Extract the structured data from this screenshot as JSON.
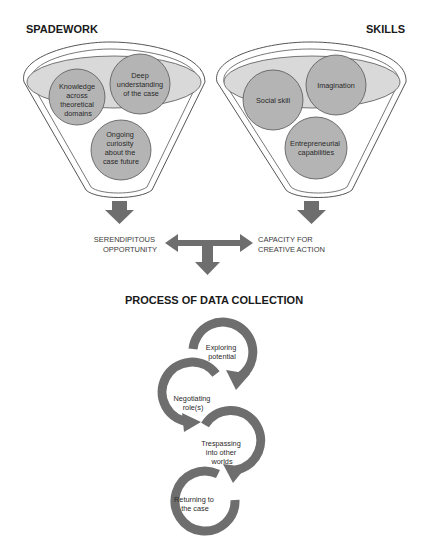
{
  "colors": {
    "background": "#ffffff",
    "funnel_outline": "#555555",
    "ellipse_fill": "#d9d9d9",
    "circle_fill": "#b4b4b4",
    "arrow_fill": "#6e6e6e",
    "text": "#222222"
  },
  "spadework": {
    "title": "SPADEWORK",
    "items": [
      {
        "lines": [
          "Knowledge",
          "across",
          "theoretical",
          "domains"
        ]
      },
      {
        "lines": [
          "Deep",
          "understanding",
          "of the case"
        ]
      },
      {
        "lines": [
          "Ongoing",
          "curiosity",
          "about the",
          "case future"
        ]
      }
    ]
  },
  "skills": {
    "title": "SKILLS",
    "items": [
      {
        "lines": [
          "Social skill"
        ]
      },
      {
        "lines": [
          "Imagination"
        ]
      },
      {
        "lines": [
          "Entrepreneurial",
          "capabilities"
        ]
      }
    ]
  },
  "outcomes": {
    "left": {
      "lines": [
        "SERENDIPITOUS",
        "OPPORTUNITY"
      ]
    },
    "right": {
      "lines": [
        "CAPACITY FOR",
        "CREATIVE ACTION"
      ]
    }
  },
  "process": {
    "title": "PROCESS OF DATA COLLECTION",
    "steps": [
      {
        "lines": [
          "Exploring",
          "potential"
        ]
      },
      {
        "lines": [
          "Negotiating",
          "role(s)"
        ]
      },
      {
        "lines": [
          "Trespassing",
          "into other",
          "worlds"
        ]
      },
      {
        "lines": [
          "Returning to",
          "the case"
        ]
      }
    ]
  }
}
